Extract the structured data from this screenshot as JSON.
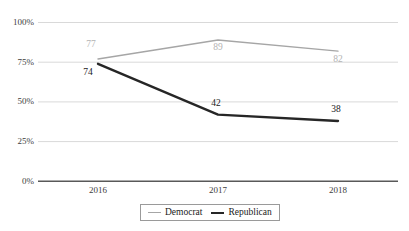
{
  "chart_data": {
    "type": "line",
    "title": "",
    "subtitle": "",
    "xlabel": "",
    "ylabel": "",
    "categories": [
      "2016",
      "2017",
      "2018"
    ],
    "series": [
      {
        "name": "Democrat",
        "color": "#a6a6a6",
        "label_color": "#b3b3b3",
        "values": [
          77,
          89,
          82
        ],
        "value_labels": [
          "77",
          "89",
          "82"
        ]
      },
      {
        "name": "Republican",
        "color": "#262626",
        "label_color": "#1a1a1a",
        "values": [
          74,
          42,
          38
        ],
        "value_labels": [
          "74",
          "42",
          "38"
        ]
      }
    ],
    "ylim": [
      0,
      100
    ],
    "yticks": [
      0,
      25,
      50,
      75,
      100
    ],
    "ytick_labels": [
      "0%",
      "25%",
      "50%",
      "75%",
      "100%"
    ],
    "grid": true,
    "grid_color": "#d9d9d9",
    "axis_color": "#595959",
    "legend_position": "bottom"
  },
  "axis": {
    "y": {
      "t100": "100%",
      "t75": "75%",
      "t50": "50%",
      "t25": "25%",
      "t0": "0%"
    },
    "x": {
      "t2016": "2016",
      "t2017": "2017",
      "t2018": "2018"
    }
  },
  "labels": {
    "dem_2016": "77",
    "dem_2017": "89",
    "dem_2018": "82",
    "rep_2016": "74",
    "rep_2017": "42",
    "rep_2018": "38"
  },
  "legend": {
    "democrat": "Democrat",
    "republican": "Republican"
  }
}
